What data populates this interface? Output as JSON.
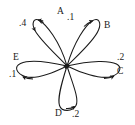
{
  "figure": {
    "type": "state-transition-self-loop-diagram",
    "background_color": "#ffffff",
    "stroke_color": "#1a1a1a",
    "center_node": {
      "name": "center-node",
      "x": 67,
      "y": 66
    }
  },
  "loops": [
    {
      "id": "a",
      "node_label": "A",
      "weight_label": ".4",
      "node_label_pos": {
        "x": 57,
        "y": 7
      },
      "weight_label_pos": {
        "x": 19,
        "y": 19
      },
      "direction": "top-left"
    },
    {
      "id": "b",
      "node_label": "B",
      "weight_label": ".1",
      "node_label_pos": {
        "x": 104,
        "y": 21
      },
      "weight_label_pos": {
        "x": 67,
        "y": 13
      },
      "direction": "top-right"
    },
    {
      "id": "c",
      "node_label": "C",
      "weight_label": ".2",
      "node_label_pos": {
        "x": 117,
        "y": 67
      },
      "weight_label_pos": {
        "x": 117,
        "y": 53
      },
      "direction": "right"
    },
    {
      "id": "d",
      "node_label": "D",
      "weight_label": ".2",
      "node_label_pos": {
        "x": 55,
        "y": 109
      },
      "weight_label_pos": {
        "x": 72,
        "y": 110
      },
      "direction": "bottom"
    },
    {
      "id": "e",
      "node_label": "E",
      "weight_label": ".1",
      "node_label_pos": {
        "x": 13,
        "y": 53
      },
      "weight_label_pos": {
        "x": 9,
        "y": 70
      },
      "direction": "left"
    }
  ]
}
